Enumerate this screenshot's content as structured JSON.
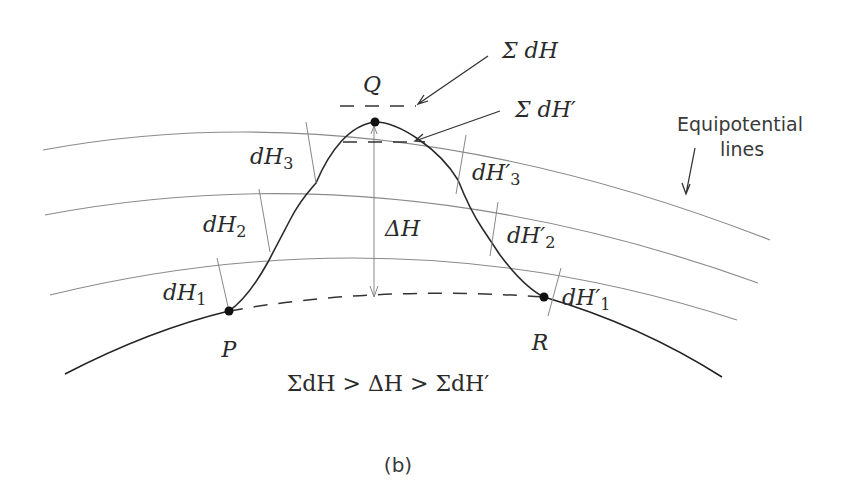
{
  "figure": {
    "caption": "(b)",
    "relation": "ΣdH > ΔH > ΣdH′",
    "points": {
      "P": "P",
      "Q": "Q",
      "R": "R"
    },
    "callouts": {
      "sum_dH": "Σ dH",
      "sum_dH_prime": "Σ dH′",
      "equipotential_line1": "Equipotential",
      "equipotential_line2": "lines",
      "delta_H": "ΔH"
    },
    "left_increments": [
      {
        "base": "dH",
        "sub": "1"
      },
      {
        "base": "dH",
        "sub": "2"
      },
      {
        "base": "dH",
        "sub": "3"
      }
    ],
    "right_increments": [
      {
        "base": "dH′",
        "sub": "1"
      },
      {
        "base": "dH′",
        "sub": "2"
      },
      {
        "base": "dH′",
        "sub": "3"
      }
    ],
    "colors": {
      "ink": "#2a2a2a",
      "equipotential": "#8a8a8a"
    }
  }
}
